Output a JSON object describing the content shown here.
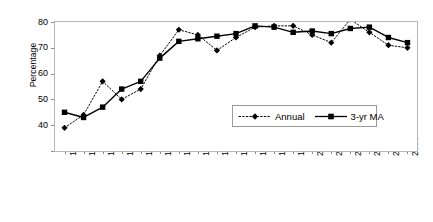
{
  "chart_data": {
    "type": "line",
    "title": "",
    "xlabel": "",
    "ylabel": "Percentage",
    "ylim": [
      30,
      80
    ],
    "yticks": [
      30,
      40,
      50,
      60,
      70,
      80
    ],
    "ytick_labels": [
      "",
      "40",
      "50",
      "60",
      "70",
      "80"
    ],
    "grid": false,
    "legend_position": "inside-lower-right",
    "categories": [
      "1987",
      "1988",
      "1989",
      "1990",
      "1991",
      "1992",
      "1993",
      "1994",
      "1995",
      "1996",
      "1997",
      "1998",
      "1999",
      "2000",
      "2001",
      "2002",
      "2003",
      "2004",
      "2005"
    ],
    "series": [
      {
        "name": "Annual",
        "marker": "diamond",
        "line_style": "dotted",
        "color": "#000000",
        "values": [
          39,
          44,
          57,
          50,
          54,
          67,
          77,
          75,
          69,
          74,
          78,
          78.5,
          78.5,
          75,
          72,
          81,
          76,
          71,
          70
        ]
      },
      {
        "name": "3-yr MA",
        "marker": "square",
        "line_style": "solid",
        "color": "#000000",
        "values": [
          45,
          43,
          47,
          54,
          57,
          66,
          72.5,
          73.5,
          74.5,
          75.5,
          78.5,
          78,
          76,
          76.5,
          75.5,
          77.5,
          78,
          74,
          72
        ]
      }
    ]
  },
  "legend": {
    "entries": [
      {
        "label": "Annual"
      },
      {
        "label": "3-yr MA"
      }
    ]
  },
  "colors": {
    "frame": "#b9b9b9",
    "series": "#000000",
    "axis_text": "#000000"
  }
}
